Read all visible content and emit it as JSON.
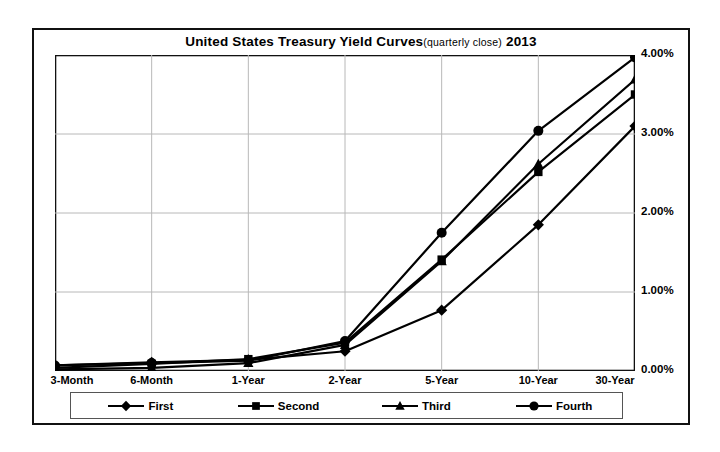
{
  "chart_data": {
    "type": "line",
    "title_main": "United States Treasury Yield Curves",
    "title_sub": "(quarterly close)",
    "title_year": "2013",
    "xlabel": "",
    "ylabel": "",
    "ylim": [
      0,
      4
    ],
    "ytick_values": [
      0,
      1,
      2,
      3,
      4
    ],
    "ytick_labels": [
      "0.00%",
      "1.00%",
      "2.00%",
      "3.00%",
      "4.00%"
    ],
    "yaxis_position": "right",
    "grid": true,
    "grid_color": "#b8b8b8",
    "legend_position": "bottom",
    "line_color": "#000000",
    "categories": [
      "3-Month",
      "6-Month",
      "1-Year",
      "2-Year",
      "5-Year",
      "10-Year",
      "30-Year"
    ],
    "series": [
      {
        "name": "First",
        "marker": "diamond",
        "values": [
          0.07,
          0.11,
          0.14,
          0.25,
          0.77,
          1.85,
          3.1
        ]
      },
      {
        "name": "Second",
        "marker": "square",
        "values": [
          0.04,
          0.09,
          0.15,
          0.36,
          1.41,
          2.52,
          3.5
        ]
      },
      {
        "name": "Third",
        "marker": "triangle",
        "values": [
          0.02,
          0.04,
          0.1,
          0.33,
          1.39,
          2.62,
          3.69
        ]
      },
      {
        "name": "Fourth",
        "marker": "circle",
        "values": [
          0.07,
          0.1,
          0.13,
          0.38,
          1.75,
          3.04,
          3.97
        ]
      }
    ]
  },
  "legend": {
    "items": [
      {
        "label": "First",
        "marker": "diamond"
      },
      {
        "label": "Second",
        "marker": "square"
      },
      {
        "label": "Third",
        "marker": "triangle"
      },
      {
        "label": "Fourth",
        "marker": "circle"
      }
    ]
  }
}
